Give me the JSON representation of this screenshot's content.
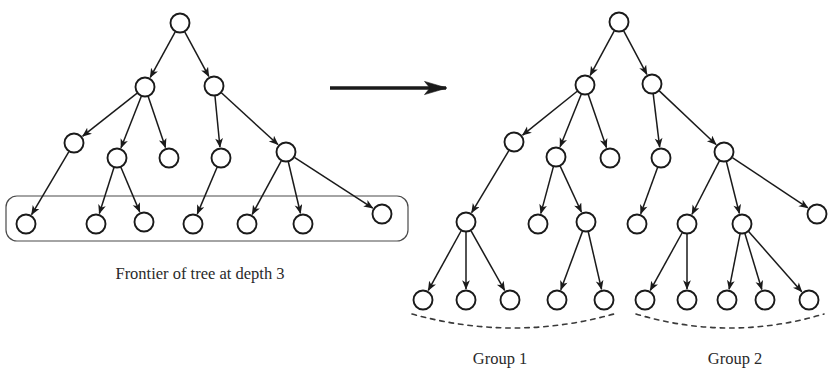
{
  "figure": {
    "type": "diagram",
    "background_color": "#ffffff",
    "stroke_color": "#1a1a1a",
    "node_fill": "#ffffff",
    "node_radius": 9.5,
    "width": 839,
    "height": 382
  },
  "labels": {
    "frontier_caption": "Frontier of tree at depth 3",
    "group1": "Group 1",
    "group2": "Group 2"
  },
  "transform_arrow": {
    "name": "transformation-arrow",
    "x1": 330,
    "y1": 88,
    "x2": 452,
    "y2": 88
  },
  "left_tree": {
    "name": "frontier-tree",
    "nodes": [
      {
        "id": "L0",
        "x": 180,
        "y": 23,
        "depth": 0
      },
      {
        "id": "L1a",
        "x": 145,
        "y": 87,
        "depth": 1
      },
      {
        "id": "L1b",
        "x": 214,
        "y": 86,
        "depth": 1
      },
      {
        "id": "L2a",
        "x": 74,
        "y": 143,
        "depth": 2
      },
      {
        "id": "L2b",
        "x": 117,
        "y": 158,
        "depth": 2
      },
      {
        "id": "L2c",
        "x": 169,
        "y": 158,
        "depth": 2
      },
      {
        "id": "L2d",
        "x": 221,
        "y": 158,
        "depth": 2
      },
      {
        "id": "L2e",
        "x": 286,
        "y": 152,
        "depth": 2
      },
      {
        "id": "L3a",
        "x": 26,
        "y": 224,
        "depth": 3
      },
      {
        "id": "L3b",
        "x": 96,
        "y": 224,
        "depth": 3
      },
      {
        "id": "L3c",
        "x": 144,
        "y": 222,
        "depth": 3
      },
      {
        "id": "L3d",
        "x": 193,
        "y": 224,
        "depth": 3
      },
      {
        "id": "L3e",
        "x": 247,
        "y": 224,
        "depth": 3
      },
      {
        "id": "L3f",
        "x": 303,
        "y": 224,
        "depth": 3
      },
      {
        "id": "L3g",
        "x": 382,
        "y": 214,
        "depth": 3
      }
    ],
    "edges": [
      [
        "L0",
        "L1a"
      ],
      [
        "L0",
        "L1b"
      ],
      [
        "L1a",
        "L2a"
      ],
      [
        "L1a",
        "L2b"
      ],
      [
        "L1a",
        "L2c"
      ],
      [
        "L1b",
        "L2d"
      ],
      [
        "L1b",
        "L2e"
      ],
      [
        "L2a",
        "L3a"
      ],
      [
        "L2b",
        "L3b"
      ],
      [
        "L2b",
        "L3c"
      ],
      [
        "L2d",
        "L3d"
      ],
      [
        "L2e",
        "L3e"
      ],
      [
        "L2e",
        "L3f"
      ],
      [
        "L2e",
        "L3g"
      ]
    ],
    "frontier_box": {
      "x": 6,
      "y": 196,
      "width": 402,
      "height": 45,
      "radius": 11
    }
  },
  "right_tree": {
    "name": "expanded-tree",
    "nodes": [
      {
        "id": "R0",
        "x": 619,
        "y": 22,
        "depth": 0
      },
      {
        "id": "R1a",
        "x": 585,
        "y": 85,
        "depth": 1
      },
      {
        "id": "R1b",
        "x": 652,
        "y": 84,
        "depth": 1
      },
      {
        "id": "R2a",
        "x": 514,
        "y": 142,
        "depth": 2
      },
      {
        "id": "R2b",
        "x": 556,
        "y": 157,
        "depth": 2
      },
      {
        "id": "R2c",
        "x": 610,
        "y": 158,
        "depth": 2
      },
      {
        "id": "R2d",
        "x": 661,
        "y": 158,
        "depth": 2
      },
      {
        "id": "R2e",
        "x": 724,
        "y": 152,
        "depth": 2
      },
      {
        "id": "R3a",
        "x": 466,
        "y": 222,
        "depth": 3
      },
      {
        "id": "R3b",
        "x": 538,
        "y": 224,
        "depth": 3
      },
      {
        "id": "R3c",
        "x": 586,
        "y": 222,
        "depth": 3
      },
      {
        "id": "R3d",
        "x": 637,
        "y": 224,
        "depth": 3
      },
      {
        "id": "R3e",
        "x": 687,
        "y": 224,
        "depth": 3
      },
      {
        "id": "R3f",
        "x": 742,
        "y": 224,
        "depth": 3
      },
      {
        "id": "R3g",
        "x": 817,
        "y": 214,
        "depth": 3
      },
      {
        "id": "R4a",
        "x": 423,
        "y": 300,
        "depth": 4,
        "group": 1
      },
      {
        "id": "R4b",
        "x": 466,
        "y": 300,
        "depth": 4,
        "group": 1
      },
      {
        "id": "R4c",
        "x": 510,
        "y": 300,
        "depth": 4,
        "group": 1
      },
      {
        "id": "R4d",
        "x": 557,
        "y": 300,
        "depth": 4,
        "group": 1
      },
      {
        "id": "R4e",
        "x": 604,
        "y": 300,
        "depth": 4,
        "group": 1
      },
      {
        "id": "R4f",
        "x": 645,
        "y": 300,
        "depth": 4,
        "group": 2
      },
      {
        "id": "R4g",
        "x": 687,
        "y": 300,
        "depth": 4,
        "group": 2
      },
      {
        "id": "R4h",
        "x": 727,
        "y": 300,
        "depth": 4,
        "group": 2
      },
      {
        "id": "R4i",
        "x": 765,
        "y": 300,
        "depth": 4,
        "group": 2
      },
      {
        "id": "R4j",
        "x": 809,
        "y": 300,
        "depth": 4,
        "group": 2
      }
    ],
    "edges": [
      [
        "R0",
        "R1a"
      ],
      [
        "R0",
        "R1b"
      ],
      [
        "R1a",
        "R2a"
      ],
      [
        "R1a",
        "R2b"
      ],
      [
        "R1a",
        "R2c"
      ],
      [
        "R1b",
        "R2d"
      ],
      [
        "R1b",
        "R2e"
      ],
      [
        "R2a",
        "R3a"
      ],
      [
        "R2b",
        "R3b"
      ],
      [
        "R2b",
        "R3c"
      ],
      [
        "R2d",
        "R3d"
      ],
      [
        "R2e",
        "R3e"
      ],
      [
        "R2e",
        "R3f"
      ],
      [
        "R2e",
        "R3g"
      ],
      [
        "R3a",
        "R4a"
      ],
      [
        "R3a",
        "R4b"
      ],
      [
        "R3a",
        "R4c"
      ],
      [
        "R3c",
        "R4d"
      ],
      [
        "R3c",
        "R4e"
      ],
      [
        "R3e",
        "R4f"
      ],
      [
        "R3e",
        "R4g"
      ],
      [
        "R3f",
        "R4h"
      ],
      [
        "R3f",
        "R4i"
      ],
      [
        "R3f",
        "R4j"
      ]
    ],
    "group_braces": [
      {
        "group": 1,
        "x1": 412,
        "y1": 314,
        "cx": 513,
        "cy": 342,
        "x2": 614,
        "y2": 314
      },
      {
        "group": 2,
        "x1": 636,
        "y1": 314,
        "cx": 730,
        "cy": 342,
        "x2": 824,
        "y2": 314
      }
    ],
    "group_label_positions": [
      {
        "group": 1,
        "x": 500,
        "y": 364
      },
      {
        "group": 2,
        "x": 735,
        "y": 364
      }
    ]
  }
}
